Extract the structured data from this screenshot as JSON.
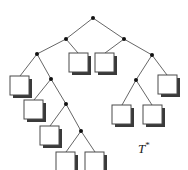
{
  "figure": {
    "width": 188,
    "height": 170,
    "background": "#ffffff",
    "label": {
      "text": "T",
      "superscript": "*",
      "full": "T*",
      "x": 138,
      "y": 141,
      "color": "#1a1a1a",
      "style": "italic-serif"
    },
    "style": {
      "edge_color": "#555555",
      "edge_width": 0.9,
      "internal_node_color": "#111111",
      "internal_node_radius": 2.0,
      "leaf_fill": "#ffffff",
      "leaf_stroke": "#4a4a4a",
      "leaf_shadow_color": "#3a3a3a",
      "leaf_size": 19,
      "leaf_shadow_offset": 3
    }
  },
  "tree": {
    "internal_nodes": [
      {
        "id": "n-root",
        "name": "root-node",
        "x": 93,
        "y": 18
      },
      {
        "id": "n-l",
        "name": "left-child-node",
        "x": 66,
        "y": 39
      },
      {
        "id": "n-r",
        "name": "right-child-node",
        "x": 124,
        "y": 39
      },
      {
        "id": "n-ll",
        "name": "left-left-node",
        "x": 37,
        "y": 54
      },
      {
        "id": "n-llr",
        "name": "left-left-right-node",
        "x": 51,
        "y": 79
      },
      {
        "id": "n-llrr",
        "name": "left-deep-node-a",
        "x": 66,
        "y": 104
      },
      {
        "id": "n-llrrr",
        "name": "left-deep-node-b",
        "x": 81,
        "y": 131
      },
      {
        "id": "n-rr",
        "name": "right-right-node",
        "x": 152,
        "y": 55
      },
      {
        "id": "n-rrl",
        "name": "right-right-left-node",
        "x": 136,
        "y": 80
      }
    ],
    "leaves": [
      {
        "id": "leaf-1",
        "name": "leaf-square-left-outer",
        "x": 10,
        "y": 76
      },
      {
        "id": "leaf-2",
        "name": "leaf-square-center-left",
        "x": 69,
        "y": 53
      },
      {
        "id": "leaf-3",
        "name": "leaf-square-center-right",
        "x": 95,
        "y": 53
      },
      {
        "id": "leaf-4",
        "name": "leaf-square-chain-a",
        "x": 24,
        "y": 100
      },
      {
        "id": "leaf-5",
        "name": "leaf-square-chain-b",
        "x": 40,
        "y": 126
      },
      {
        "id": "leaf-6",
        "name": "leaf-square-bottom-left",
        "x": 56,
        "y": 152
      },
      {
        "id": "leaf-7",
        "name": "leaf-square-bottom-right",
        "x": 85,
        "y": 152
      },
      {
        "id": "leaf-8",
        "name": "leaf-square-right-inner",
        "x": 112,
        "y": 105
      },
      {
        "id": "leaf-9",
        "name": "leaf-square-right-mid",
        "x": 143,
        "y": 105
      },
      {
        "id": "leaf-10",
        "name": "leaf-square-right-outer",
        "x": 158,
        "y": 75
      }
    ],
    "edges": [
      {
        "name": "edge-root-left",
        "x1": 93,
        "y1": 18,
        "x2": 66,
        "y2": 39
      },
      {
        "name": "edge-root-right",
        "x1": 93,
        "y1": 18,
        "x2": 124,
        "y2": 39
      },
      {
        "name": "edge-l-ll",
        "x1": 66,
        "y1": 39,
        "x2": 37,
        "y2": 54
      },
      {
        "name": "edge-l-leaf2",
        "x1": 66,
        "y1": 39,
        "x2": 78,
        "y2": 53
      },
      {
        "name": "edge-r-leaf3",
        "x1": 124,
        "y1": 39,
        "x2": 105,
        "y2": 53
      },
      {
        "name": "edge-r-rr",
        "x1": 124,
        "y1": 39,
        "x2": 152,
        "y2": 55
      },
      {
        "name": "edge-ll-leaf1",
        "x1": 37,
        "y1": 54,
        "x2": 20,
        "y2": 76
      },
      {
        "name": "edge-ll-llr",
        "x1": 37,
        "y1": 54,
        "x2": 51,
        "y2": 79
      },
      {
        "name": "edge-llr-leaf4",
        "x1": 51,
        "y1": 79,
        "x2": 34,
        "y2": 100
      },
      {
        "name": "edge-llr-llrr",
        "x1": 51,
        "y1": 79,
        "x2": 66,
        "y2": 104
      },
      {
        "name": "edge-llrr-leaf5",
        "x1": 66,
        "y1": 104,
        "x2": 50,
        "y2": 126
      },
      {
        "name": "edge-llrr-llrrr",
        "x1": 66,
        "y1": 104,
        "x2": 81,
        "y2": 131
      },
      {
        "name": "edge-llrrr-leaf6",
        "x1": 81,
        "y1": 131,
        "x2": 66,
        "y2": 152
      },
      {
        "name": "edge-llrrr-leaf7",
        "x1": 81,
        "y1": 131,
        "x2": 95,
        "y2": 152
      },
      {
        "name": "edge-rr-rrl",
        "x1": 152,
        "y1": 55,
        "x2": 136,
        "y2": 80
      },
      {
        "name": "edge-rr-leaf10",
        "x1": 152,
        "y1": 55,
        "x2": 167,
        "y2": 75
      },
      {
        "name": "edge-rrl-leaf8",
        "x1": 136,
        "y1": 80,
        "x2": 122,
        "y2": 105
      },
      {
        "name": "edge-rrl-leaf9",
        "x1": 136,
        "y1": 80,
        "x2": 152,
        "y2": 105
      }
    ]
  }
}
